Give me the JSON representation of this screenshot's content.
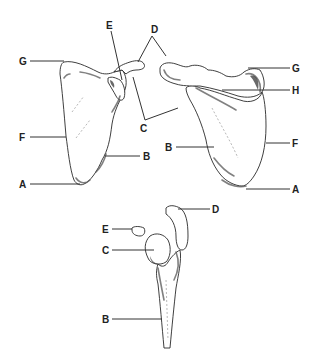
{
  "figure": {
    "type": "anatomical line drawing",
    "colors": {
      "background": "#ffffff",
      "ink": "#222222"
    }
  },
  "views": [
    {
      "id": "anterior",
      "labels": [
        {
          "key": "G",
          "text": "G"
        },
        {
          "key": "E",
          "text": "E"
        },
        {
          "key": "D",
          "text": "D"
        },
        {
          "key": "C",
          "text": "C"
        },
        {
          "key": "F",
          "text": "F"
        },
        {
          "key": "B",
          "text": "B"
        },
        {
          "key": "A",
          "text": "A"
        }
      ]
    },
    {
      "id": "posterior",
      "labels": [
        {
          "key": "G",
          "text": "G"
        },
        {
          "key": "H",
          "text": "H"
        },
        {
          "key": "B",
          "text": "B"
        },
        {
          "key": "F",
          "text": "F"
        },
        {
          "key": "A",
          "text": "A"
        }
      ]
    },
    {
      "id": "lateral",
      "labels": [
        {
          "key": "D",
          "text": "D"
        },
        {
          "key": "E",
          "text": "E"
        },
        {
          "key": "C",
          "text": "C"
        },
        {
          "key": "B",
          "text": "B"
        }
      ]
    }
  ]
}
